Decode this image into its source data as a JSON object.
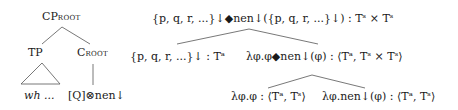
{
  "left_tree": {
    "root": {
      "main": "CP",
      "sub": "ROOT"
    },
    "left_child": {
      "label": "TP"
    },
    "right_child": {
      "main": "C",
      "sub": "ROOT"
    },
    "tp_leaf": "wh ...",
    "c_leaf": "[Q]⊗nen↓"
  },
  "right_tree": {
    "root": "{p, q, r, ...}↓◆nen↓({p, q, r, ...}↓) : Tˢ × Tˢ",
    "left_child": "{p, q, r, ...}↓ : Tᵃ",
    "right_child": "λφ.φ◆nen↓(φ) : ⟨Tᵃ, Tˢ × Tˢ⟩",
    "right_left_leaf": "λφ.φ : ⟨Tᵃ, Tˢ⟩",
    "right_right_leaf": "λφ.nen↓(φ) : ⟨Tᵃ, Tˢ⟩"
  },
  "colors": {
    "text": "#1a1a1a",
    "lines": "#555555"
  }
}
